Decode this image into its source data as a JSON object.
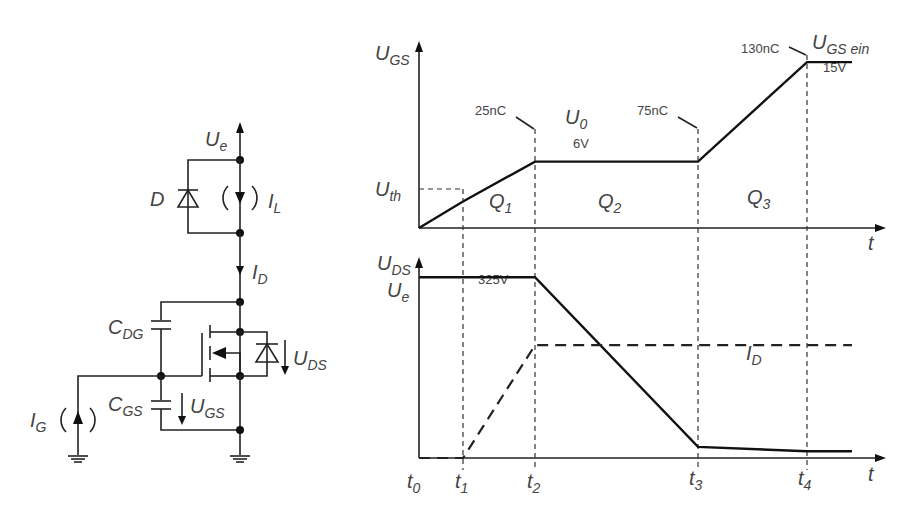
{
  "circuit": {
    "supply_label": "U",
    "supply_sub": "e",
    "diode_label": "D",
    "load_current_label": "I",
    "load_current_sub": "L",
    "drain_current_label": "I",
    "drain_current_sub": "D",
    "cdg_label": "C",
    "cdg_sub": "DG",
    "cgs_label": "C",
    "cgs_sub": "GS",
    "ugs_label": "U",
    "ugs_sub": "GS",
    "uds_label": "U",
    "uds_sub": "DS",
    "gate_current_label": "I",
    "gate_current_sub": "G"
  },
  "chart_data": [
    {
      "type": "line",
      "title": "Gate-source voltage vs time",
      "ylabel": "U",
      "ylabel_sub": "GS",
      "xlabel": "t",
      "x": [
        "t0",
        "t1",
        "t2",
        "t3",
        "t4",
        "end"
      ],
      "series": [
        {
          "name": "U_GS",
          "style": "solid",
          "values": [
            0,
            2.4,
            6,
            6,
            15,
            15
          ]
        }
      ],
      "levels": {
        "Uth": {
          "label": "U",
          "sub": "th",
          "value": 2.4
        },
        "U0": {
          "label": "U",
          "sub": "0",
          "value": 6,
          "text": "6V"
        },
        "UGS_ein": {
          "label": "U",
          "sub": "GS ein",
          "value": 15,
          "text": "15V"
        }
      },
      "annotations": [
        "25nC",
        "75nC",
        "130nC"
      ],
      "regions": [
        {
          "label": "Q",
          "sub": "1"
        },
        {
          "label": "Q",
          "sub": "2"
        },
        {
          "label": "Q",
          "sub": "3"
        }
      ],
      "ylim": [
        0,
        17
      ]
    },
    {
      "type": "line",
      "title": "Drain-source voltage and drain current vs time",
      "ylabel": "U",
      "ylabel_sub": "DS",
      "xlabel": "t",
      "x": [
        "t0",
        "t1",
        "t2",
        "t3",
        "t4",
        "end"
      ],
      "tick_labels": [
        {
          "label": "t",
          "sub": "0"
        },
        {
          "label": "t",
          "sub": "1"
        },
        {
          "label": "t",
          "sub": "2"
        },
        {
          "label": "t",
          "sub": "3"
        },
        {
          "label": "t",
          "sub": "4"
        }
      ],
      "series": [
        {
          "name": "U_DS",
          "style": "solid",
          "values": [
            325,
            325,
            325,
            20,
            12,
            12
          ]
        },
        {
          "name": "I_D",
          "label": "I",
          "sub": "D",
          "style": "dashed",
          "values_relative": [
            0,
            0,
            0.6,
            0.6,
            0.6,
            0.6
          ]
        }
      ],
      "levels": {
        "Ue": {
          "label": "U",
          "sub": "e",
          "value": 325,
          "text": "325V"
        }
      },
      "ylim": [
        0,
        365
      ]
    }
  ]
}
